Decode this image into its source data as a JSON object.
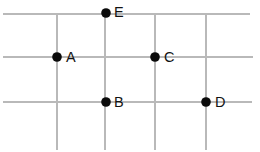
{
  "figure": {
    "type": "point-grid-diagram",
    "width": 260,
    "height": 152,
    "background_color": "#ffffff",
    "grid_color": "#b9b9b9",
    "point_color": "#0a0a0a",
    "label_color": "#121212"
  },
  "grid": {
    "horizontal_lines": [
      {
        "name": "horizontal-line-top",
        "y": 14,
        "x1": 3,
        "x2": 250
      },
      {
        "name": "horizontal-line-middle",
        "y": 57,
        "x1": 3,
        "x2": 253
      },
      {
        "name": "horizontal-line-bottom",
        "y": 102,
        "x1": 3,
        "x2": 252
      }
    ],
    "vertical_lines": [
      {
        "name": "vertical-line-1",
        "x": 57,
        "y1": 14,
        "y2": 150
      },
      {
        "name": "vertical-line-2",
        "x": 105,
        "y1": 14,
        "y2": 150
      },
      {
        "name": "vertical-line-3",
        "x": 155,
        "y1": 14,
        "y2": 150
      },
      {
        "name": "vertical-line-4",
        "x": 206,
        "y1": 14,
        "y2": 150
      }
    ]
  },
  "points": [
    {
      "label": "E",
      "cx": 106,
      "cy": 13,
      "r": 4.8,
      "label_x": 114,
      "label_y": 13
    },
    {
      "label": "A",
      "cx": 57,
      "cy": 57,
      "r": 4.8,
      "label_x": 66,
      "label_y": 58
    },
    {
      "label": "C",
      "cx": 155,
      "cy": 57,
      "r": 4.8,
      "label_x": 164,
      "label_y": 58
    },
    {
      "label": "B",
      "cx": 106,
      "cy": 102,
      "r": 4.8,
      "label_x": 114,
      "label_y": 103
    },
    {
      "label": "D",
      "cx": 206,
      "cy": 102,
      "r": 4.8,
      "label_x": 215,
      "label_y": 103
    }
  ]
}
